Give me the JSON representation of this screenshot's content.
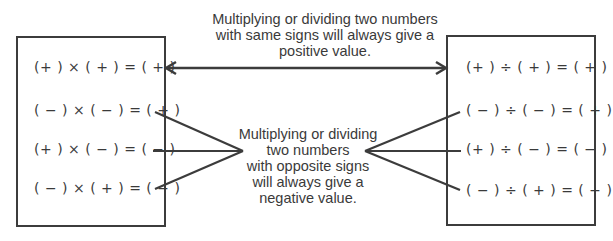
{
  "captions": {
    "same_signs": [
      "Multiplying or dividing two numbers",
      "with same signs will always give a",
      "positive value."
    ],
    "opposite_signs": [
      "Multiplying or dividing",
      "two numbers",
      "with opposite signs",
      "will always give a",
      "negative value."
    ]
  },
  "multiplication_box": {
    "equations": [
      "(+ ) × ( + ) = ( + )",
      "( − ) × ( − ) = ( + )",
      "(+ ) × ( − ) = ( − )",
      "( − ) × ( + ) = ( − )"
    ]
  },
  "division_box": {
    "equations": [
      "(+ ) ÷ ( + ) = ( + )",
      "( − ) ÷ ( − ) = ( + )",
      "(+ ) ÷ ( − ) = ( − )",
      "( − ) ÷ ( + ) = ( − )"
    ]
  },
  "colors": {
    "line": "#3c3c3c",
    "text": "#3a3a3a",
    "background": "#ffffff"
  }
}
